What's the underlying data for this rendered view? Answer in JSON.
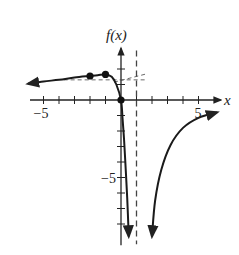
{
  "chart_data": {
    "type": "line",
    "title": "",
    "xlabel": "x",
    "ylabel": "f(x)",
    "xlim": [
      -6,
      6.3
    ],
    "ylim": [
      -9.3,
      3.4
    ],
    "x_tick_step": 1,
    "y_tick_step": 1,
    "x_tick_labels": [
      {
        "value": -5,
        "label": "−5"
      },
      {
        "value": 5,
        "label": "5"
      }
    ],
    "y_tick_labels": [
      {
        "value": -5,
        "label": "−5"
      }
    ],
    "grid": false,
    "legend": null,
    "series": [
      {
        "name": "left-branch",
        "points": [
          [
            -6,
            1.05
          ],
          [
            -5,
            1.2
          ],
          [
            -4,
            1.3
          ],
          [
            -3,
            1.45
          ],
          [
            -2,
            1.55
          ],
          [
            -1.5,
            1.6
          ],
          [
            -1,
            1.65
          ],
          [
            -0.6,
            1.5
          ],
          [
            -0.3,
            1.0
          ],
          [
            0,
            0
          ],
          [
            0.1,
            -1.2
          ],
          [
            0.2,
            -2.6
          ],
          [
            0.3,
            -4.4
          ],
          [
            0.4,
            -6.3
          ],
          [
            0.5,
            -8.8
          ]
        ],
        "arrow_start": true,
        "arrow_end": true
      },
      {
        "name": "right-branch",
        "points": [
          [
            2,
            -8.8
          ],
          [
            2.2,
            -6.5
          ],
          [
            2.6,
            -4.5
          ],
          [
            3.2,
            -2.9
          ],
          [
            4,
            -1.8
          ],
          [
            5,
            -1.15
          ],
          [
            6.2,
            -0.8
          ]
        ],
        "arrow_start": true,
        "arrow_end": true
      }
    ],
    "marked_points": [
      {
        "x": -2,
        "y": 1.55
      },
      {
        "x": -1,
        "y": 1.65
      },
      {
        "x": 0,
        "y": 0
      }
    ],
    "asymptotes": [
      {
        "type": "vertical",
        "x": 1,
        "style": "dashed"
      },
      {
        "type": "horizontal",
        "y": 1.3,
        "x_range": [
          -3.7,
          1.7
        ],
        "style": "dashed"
      },
      {
        "type": "slant",
        "from": [
          -0.45,
          1.15
        ],
        "to": [
          1.7,
          1.7
        ],
        "style": "dashed"
      }
    ]
  },
  "pixel_map": {
    "origin_x": 121,
    "origin_y": 100,
    "unit": 15.5
  }
}
